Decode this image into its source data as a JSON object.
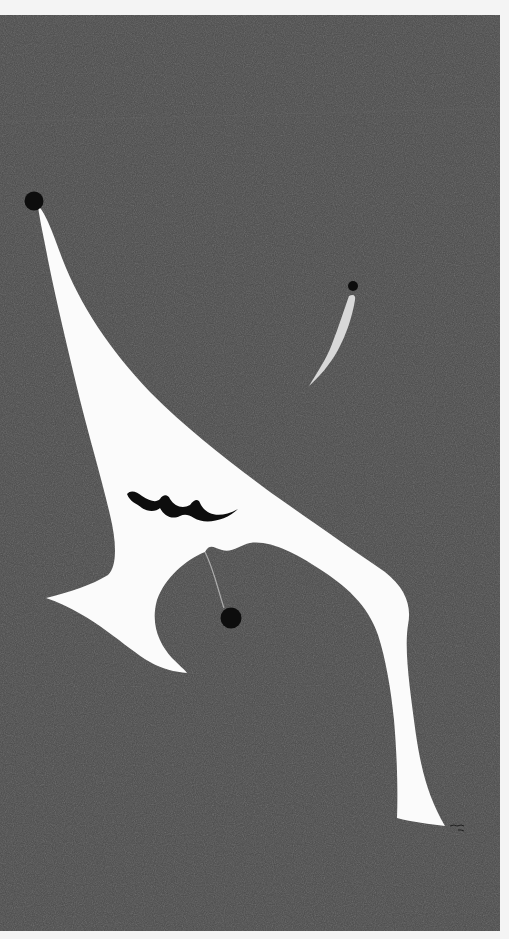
{
  "image": {
    "kind": "painting",
    "description": "Abstract painting: a large white biomorphic figure with a black dot at its upper tip, a black wavy mark on its body, a small grey-white sliver topped by a black dot, and another black dot below the figure's arch, on a dark grey textured ground with a white border.",
    "colors": {
      "border": "#f4f4f4",
      "ground": "#4a4a4a",
      "figure": "#fbfbfb",
      "mark": "#0d0d0d",
      "sliver": "#d8d8d8"
    },
    "signature_visible": true
  }
}
